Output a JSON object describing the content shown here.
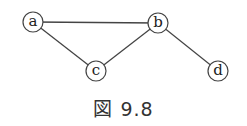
{
  "figure": {
    "caption": "図 9.8",
    "nodes": [
      {
        "id": "a",
        "label": "a",
        "x": 33,
        "y": 22
      },
      {
        "id": "b",
        "label": "b",
        "x": 158,
        "y": 23
      },
      {
        "id": "c",
        "label": "c",
        "x": 96,
        "y": 71
      },
      {
        "id": "d",
        "label": "d",
        "x": 218,
        "y": 71
      }
    ],
    "edges": [
      {
        "from": "a",
        "to": "b"
      },
      {
        "from": "a",
        "to": "c"
      },
      {
        "from": "c",
        "to": "b"
      },
      {
        "from": "b",
        "to": "d"
      }
    ]
  }
}
